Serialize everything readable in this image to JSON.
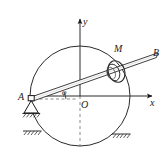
{
  "figure": {
    "type": "mechanism-diagram",
    "background_color": "#ffffff",
    "stroke_color": "#1a1a1a",
    "labels": {
      "point_a": "A",
      "point_b": "B",
      "point_m": "M",
      "origin": "O",
      "axis_x": "x",
      "axis_y": "y",
      "angle": "φ"
    },
    "geometry": {
      "circle": {
        "cx": 80,
        "cy": 96,
        "r": 50
      },
      "origin": {
        "x": 80,
        "y": 96
      },
      "point_a": {
        "x": 31,
        "y": 99
      },
      "point_b": {
        "x": 157,
        "y": 55
      },
      "collar_m": {
        "x": 116,
        "y": 70
      },
      "axis_x_end": {
        "x": 155,
        "y": 96
      },
      "axis_y_end": {
        "x": 80,
        "y": 17
      },
      "rod_angle_deg": 19
    },
    "elements": [
      "circle",
      "rod-ab",
      "collar-m",
      "pin-support-a",
      "ground-hatch-upper-left",
      "ground-hatch-lower-left",
      "ground-hatch-right",
      "x-axis",
      "y-axis",
      "angle-arc",
      "horizontal-reference-dashed",
      "vertical-dashed"
    ]
  }
}
